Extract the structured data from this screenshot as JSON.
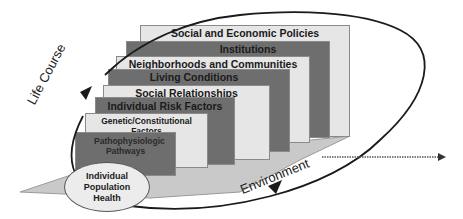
{
  "diagram": {
    "layers": [
      {
        "label": "Social and Economic Policies",
        "tone": "light"
      },
      {
        "label": "Institutions",
        "tone": "dark"
      },
      {
        "label": "Neighborhoods and Communities",
        "tone": "light"
      },
      {
        "label": "Living Conditions",
        "tone": "dark"
      },
      {
        "label": "Social Relationships",
        "tone": "light"
      },
      {
        "label": "Individual Risk Factors",
        "tone": "dark"
      },
      {
        "label": "Genetic/Constitutional Factors",
        "tone": "light"
      },
      {
        "label": "Pathophysiologic Pathways",
        "tone": "dark"
      }
    ],
    "center": {
      "label": "Individual Population Health"
    },
    "cycle_label": "Life Course",
    "floor_label": "Environment",
    "colors": {
      "light_panel": "#e6e6e6",
      "dark_panel": "#6e6e6e",
      "floor": "#c8c8c8",
      "ellipse_stroke": "#1a1a1a"
    }
  }
}
